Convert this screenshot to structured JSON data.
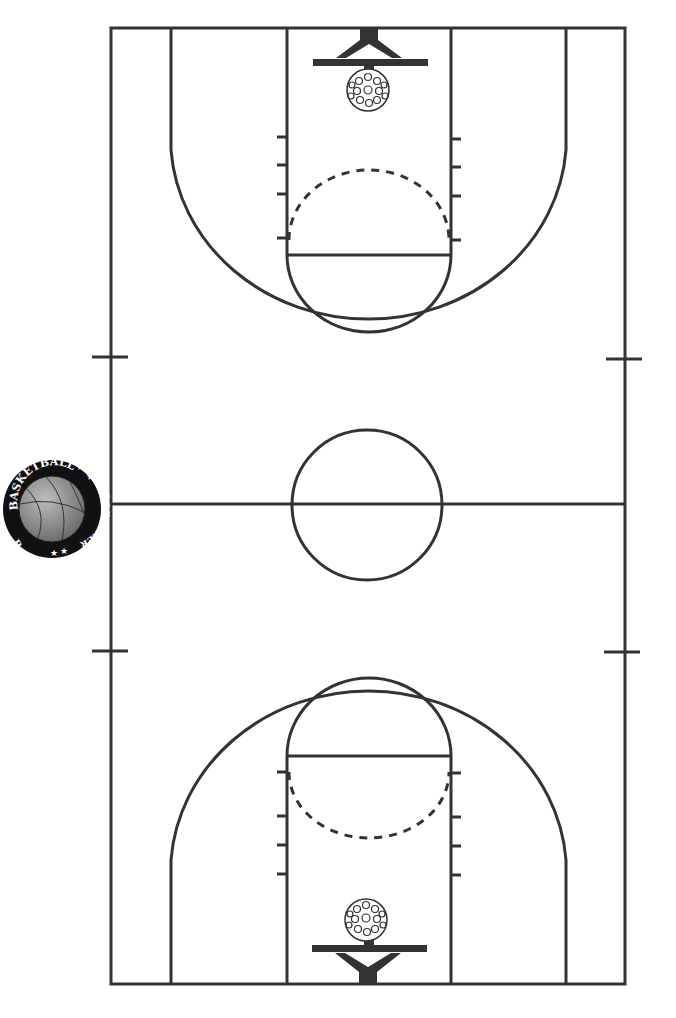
{
  "diagram": {
    "type": "basketball-court",
    "orientation": "vertical",
    "line_color": "#333333",
    "background": "#ffffff",
    "logo": {
      "top_text": "BASKETBALL",
      "bottom_text": "STAT TRACKER",
      "stars": "★ ★",
      "ball_color": "#8a8a8a"
    }
  }
}
